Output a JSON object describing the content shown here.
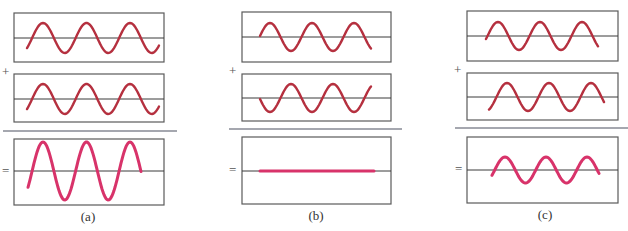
{
  "figure": {
    "colors": {
      "input_wave": "#b5303f",
      "result_wave": "#d8336a",
      "box_border": "#5a5a5a",
      "axis": "#3a3a3a",
      "separator": "#4d5060"
    },
    "panels": [
      {
        "label": "(a)",
        "plus": "+",
        "equals": "=",
        "description": "constructive interference",
        "box": {
          "x": 14,
          "w": 150
        },
        "rows": [
          {
            "kind": "input",
            "y": 13,
            "h": 49,
            "center": 38,
            "amp": 15,
            "x0": 27,
            "x1": 159,
            "phase": -0.2,
            "period": 43.5,
            "peak_x": 43
          },
          {
            "kind": "input",
            "y": 74,
            "h": 48,
            "center": 99,
            "amp": 15,
            "x0": 27,
            "x1": 159,
            "phase": -0.2,
            "period": 43.5,
            "peak_x": 43
          },
          {
            "kind": "result",
            "y": 139,
            "h": 66,
            "center": 171,
            "amp": 29,
            "x0": 28,
            "x1": 141,
            "period": 43.5,
            "peak_x": 43
          }
        ],
        "separator": {
          "x1": 3,
          "x2": 177,
          "y": 131
        },
        "plus_pos": {
          "x": 2,
          "y": 76
        },
        "equals_pos": {
          "x": 2,
          "y": 175
        },
        "label_pos": {
          "x": 88,
          "y": 221
        }
      },
      {
        "label": "(b)",
        "plus": "+",
        "equals": "=",
        "description": "destructive interference",
        "box": {
          "x": 242,
          "w": 149
        },
        "rows": [
          {
            "kind": "input",
            "y": 12,
            "h": 50,
            "center": 37,
            "amp": 14,
            "x0": 260,
            "x1": 371,
            "period": 42,
            "peak_x": 270
          },
          {
            "kind": "input",
            "y": 74,
            "h": 47,
            "center": 98,
            "amp": 14,
            "x0": 260,
            "x1": 371,
            "period": 42,
            "peak_x": 291
          },
          {
            "kind": "result",
            "y": 137,
            "h": 67,
            "center": 171,
            "amp": 0,
            "x0": 260,
            "x1": 374,
            "period": 42,
            "peak_x": 270
          }
        ],
        "separator": {
          "x1": 229,
          "x2": 402,
          "y": 129
        },
        "plus_pos": {
          "x": 229,
          "y": 75
        },
        "equals_pos": {
          "x": 229,
          "y": 174
        },
        "label_pos": {
          "x": 316,
          "y": 220
        }
      },
      {
        "label": "(c)",
        "plus": "+",
        "equals": "=",
        "description": "partial interference",
        "box": {
          "x": 467,
          "w": 151
        },
        "rows": [
          {
            "kind": "input",
            "y": 11,
            "h": 50,
            "center": 36,
            "amp": 14,
            "x0": 486,
            "x1": 598,
            "period": 42,
            "peak_x": 498
          },
          {
            "kind": "input",
            "y": 73,
            "h": 47,
            "center": 97,
            "amp": 14,
            "x0": 489,
            "x1": 604,
            "period": 42,
            "peak_x": 507
          },
          {
            "kind": "result",
            "y": 137,
            "h": 66,
            "center": 170,
            "amp": 13,
            "x0": 492,
            "x1": 599,
            "period": 41,
            "peak_x": 505
          }
        ],
        "separator": {
          "x1": 455,
          "x2": 628,
          "y": 128
        },
        "plus_pos": {
          "x": 454,
          "y": 74
        },
        "equals_pos": {
          "x": 455,
          "y": 173
        },
        "label_pos": {
          "x": 545,
          "y": 219
        }
      }
    ]
  }
}
